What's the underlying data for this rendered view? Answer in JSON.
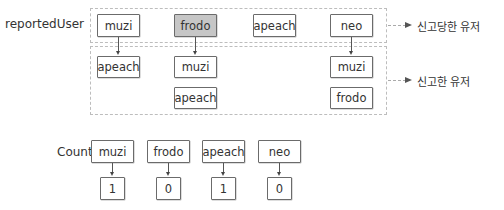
{
  "diagram": {
    "reported_row_label": "reportedUser",
    "count_row_label": "Count",
    "legend": {
      "reported": "신고당한 유저",
      "reporter": "신고한 유저"
    },
    "reported_users": [
      {
        "name": "muzi",
        "highlighted": false,
        "reporters": [
          "apeach"
        ]
      },
      {
        "name": "frodo",
        "highlighted": true,
        "reporters": [
          "muzi",
          "apeach"
        ]
      },
      {
        "name": "apeach",
        "highlighted": false,
        "reporters": []
      },
      {
        "name": "neo",
        "highlighted": false,
        "reporters": [
          "muzi",
          "frodo"
        ]
      }
    ],
    "counts": [
      {
        "name": "muzi",
        "value": "1"
      },
      {
        "name": "frodo",
        "value": "0"
      },
      {
        "name": "apeach",
        "value": "1"
      },
      {
        "name": "neo",
        "value": "0"
      }
    ],
    "colors": {
      "highlight_fill": "#c6c6c6",
      "box_border": "#6b6b6b",
      "group_border": "#bdbdbd"
    }
  }
}
